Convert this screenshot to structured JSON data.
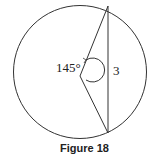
{
  "figure": {
    "caption": "Figure 18",
    "angle_label": "145°",
    "chord_label": "3",
    "stroke_color": "#333333"
  }
}
